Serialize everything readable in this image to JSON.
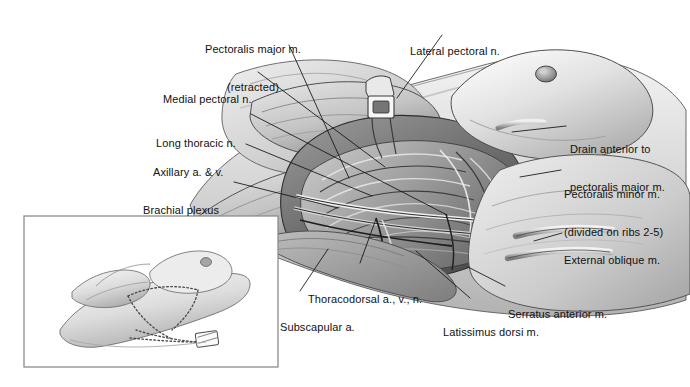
{
  "figure": {
    "kind": "medical-illustration",
    "style": "grayscale pen-and-ink / airbrush anatomical drawing",
    "background_color": "#ffffff",
    "ink_color": "#111111"
  },
  "labels": [
    {
      "id": "pectoralis-major",
      "line1": "Pectoralis major m.",
      "line2": "(retracted)",
      "x": 253,
      "y": 18,
      "align": "center"
    },
    {
      "id": "lateral-pectoral-n",
      "line1": "Lateral pectoral n.",
      "line2": "",
      "x": 410,
      "y": 20,
      "align": "left"
    },
    {
      "id": "medial-pectoral-n",
      "line1": "Medial pectoral n.",
      "line2": "",
      "x": 163,
      "y": 68,
      "align": "left"
    },
    {
      "id": "long-thoracic-n",
      "line1": "Long thoracic n.",
      "line2": "",
      "x": 156,
      "y": 112,
      "align": "left"
    },
    {
      "id": "axillary-a-v",
      "line1": "Axillary a. & v.",
      "line2": "",
      "x": 153,
      "y": 141,
      "align": "left"
    },
    {
      "id": "brachial-plexus",
      "line1": "Brachial plexus",
      "line2": "",
      "x": 143,
      "y": 179,
      "align": "left"
    },
    {
      "id": "drain-anterior",
      "line1": "Drain anterior to",
      "line2": "pectoralis major m.",
      "x": 570,
      "y": 118,
      "align": "left"
    },
    {
      "id": "pectoralis-minor",
      "line1": "Pectoralis minor m.",
      "line2": "(divided on ribs 2-5)",
      "x": 564,
      "y": 163,
      "align": "left"
    },
    {
      "id": "external-oblique",
      "line1": "External oblique m.",
      "line2": "",
      "x": 564,
      "y": 229,
      "align": "left"
    },
    {
      "id": "thoracodorsal",
      "line1": "Thoracodorsal a., v., n.",
      "line2": "",
      "x": 308,
      "y": 268,
      "align": "left"
    },
    {
      "id": "serratus-anterior",
      "line1": "Serratus anterior m.",
      "line2": "",
      "x": 508,
      "y": 283,
      "align": "left"
    },
    {
      "id": "subscapular-a",
      "line1": "Subscapular a.",
      "line2": "",
      "x": 280,
      "y": 296,
      "align": "left"
    },
    {
      "id": "latissimus-dorsi",
      "line1": "Latissimus dorsi m.",
      "line2": "",
      "x": 443,
      "y": 301,
      "align": "left"
    }
  ],
  "inset": {
    "name": "patient-position-inset",
    "border_color": "#6f6f6f",
    "x": 24,
    "y": 216,
    "width": 254,
    "height": 151,
    "content": "Supine patient with arm abducted; dotted lines mark planned mastectomy incision and axillary drain site"
  },
  "leaders": [
    {
      "id": "leader-pectoralis-major",
      "points": "289,45 349,178"
    },
    {
      "id": "leader-lateral-pectoral",
      "points": "442,35 397,98"
    },
    {
      "id": "leader-medial-pectoral",
      "points": "258,72 385,167"
    },
    {
      "id": "leader-long-thoracic",
      "points": "251,114 447,215"
    },
    {
      "id": "leader-axillary",
      "points": "246,144 372,196"
    },
    {
      "id": "leader-brachial-plexus",
      "points": "234,182 338,208"
    },
    {
      "id": "leader-drain-anterior",
      "points": "566,126 515,133"
    },
    {
      "id": "leader-pectoralis-minor",
      "points": "561,170 523,176"
    },
    {
      "id": "leader-external-oblique",
      "points": "562,233 537,240"
    },
    {
      "id": "leader-thoracodorsal",
      "points": "360,263 375,220"
    },
    {
      "id": "leader-serratus",
      "points": "505,286 470,268"
    },
    {
      "id": "leader-subscapular",
      "points": "300,291 327,250"
    },
    {
      "id": "leader-latissimus",
      "points": "470,298 418,252"
    }
  ]
}
